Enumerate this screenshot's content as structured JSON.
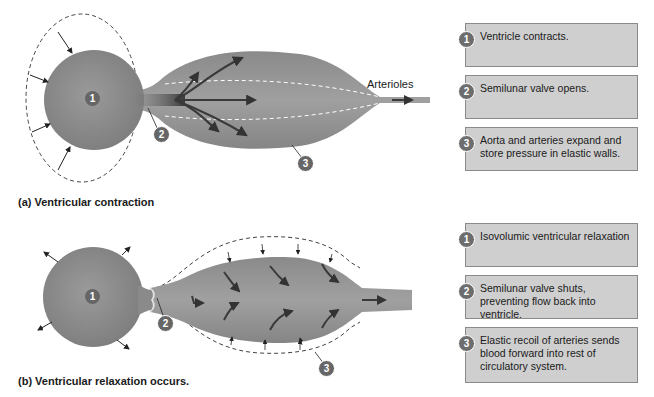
{
  "panels": [
    {
      "id": "a",
      "title": "(a) Ventricular contraction",
      "diagram_labels": {
        "ventricle_marker": "1",
        "valve_marker": "2",
        "artery_marker": "3",
        "arterioles": "Arterioles"
      },
      "steps": [
        {
          "number": "1",
          "text": "Ventricle contracts."
        },
        {
          "number": "2",
          "text": "Semilunar valve opens."
        },
        {
          "number": "3",
          "text": "Aorta and arteries expand and store pressure in elastic walls."
        }
      ]
    },
    {
      "id": "b",
      "title": "(b) Ventricular relaxation occurs.",
      "diagram_labels": {
        "ventricle_marker": "1",
        "valve_marker": "2",
        "artery_marker": "3"
      },
      "steps": [
        {
          "number": "1",
          "text": "Isovolumic ventricular relaxation"
        },
        {
          "number": "2",
          "text": "Semilunar valve shuts, preventing flow back into ventricle."
        },
        {
          "number": "3",
          "text": "Elastic recoil of arteries sends blood forward into rest of circulatory system."
        }
      ]
    }
  ],
  "colors": {
    "chamber_fill": "#8c8c8c",
    "box_fill": "#cfcfcf",
    "marker_fill": "#6d6d6d",
    "arrow_dark": "#3a3a3a"
  }
}
